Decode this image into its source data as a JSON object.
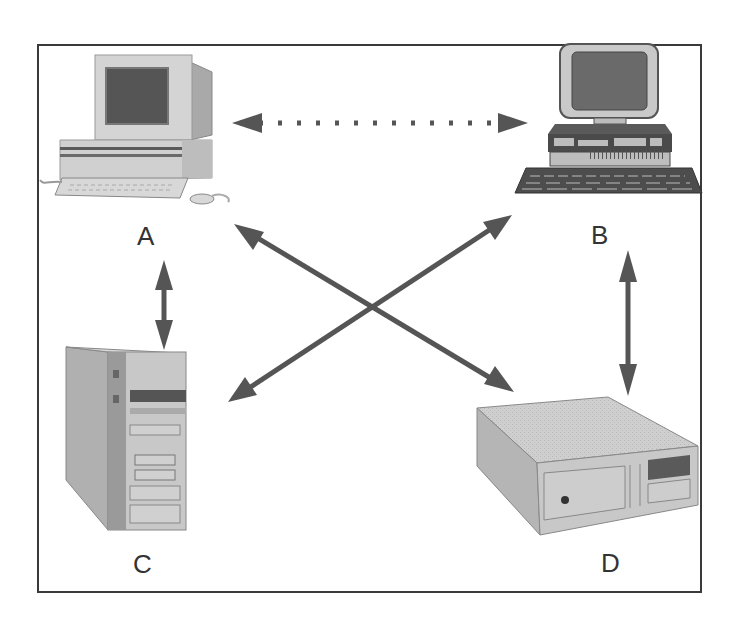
{
  "diagram": {
    "type": "network-topology",
    "colors": {
      "frame": "#3a3a3a",
      "arrow": "#555555",
      "device_light": "#d2d2d2",
      "device_mid": "#a8a8a8",
      "device_dark": "#5a5a5a",
      "label": "#333333"
    },
    "nodes": [
      {
        "id": "A",
        "label": "A",
        "device": "desktop-computer-with-crt-monitor"
      },
      {
        "id": "B",
        "label": "B",
        "device": "workstation-with-monitor-and-keyboard"
      },
      {
        "id": "C",
        "label": "C",
        "device": "tower-server"
      },
      {
        "id": "D",
        "label": "D",
        "device": "desktop-box-unit"
      }
    ],
    "edges": [
      {
        "from": "A",
        "to": "B",
        "style": "dotted",
        "direction": "bidirectional"
      },
      {
        "from": "A",
        "to": "C",
        "style": "solid",
        "direction": "bidirectional"
      },
      {
        "from": "A",
        "to": "D",
        "style": "solid",
        "direction": "bidirectional"
      },
      {
        "from": "B",
        "to": "C",
        "style": "solid",
        "direction": "bidirectional"
      },
      {
        "from": "B",
        "to": "D",
        "style": "solid",
        "direction": "bidirectional"
      }
    ]
  }
}
